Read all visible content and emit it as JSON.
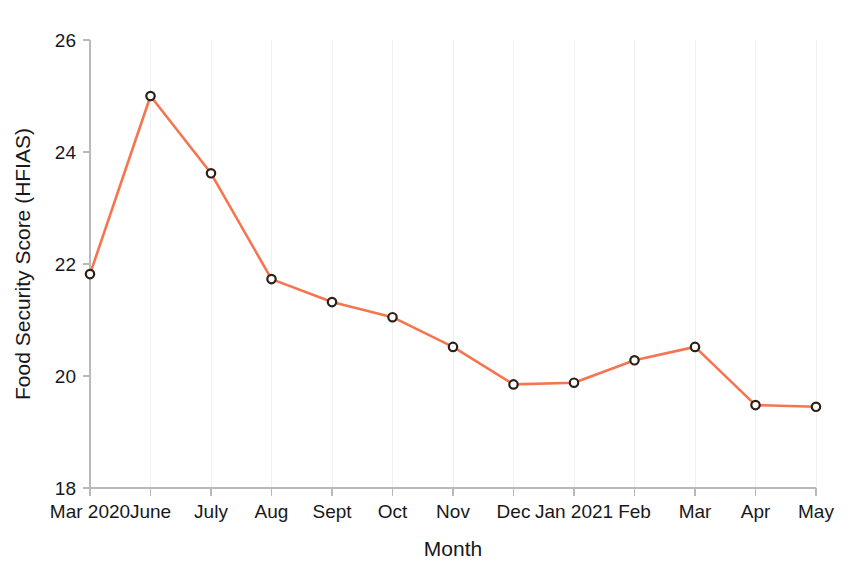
{
  "chart_data": {
    "type": "line",
    "title": "",
    "xlabel": "Month",
    "ylabel": "Food Security Score (HFIAS)",
    "categories": [
      "Mar 2020",
      "June",
      "July",
      "Aug",
      "Sept",
      "Oct",
      "Nov",
      "Dec",
      "Jan 2021",
      "Feb",
      "Mar",
      "Apr",
      "May"
    ],
    "values": [
      21.82,
      25.0,
      23.62,
      21.73,
      21.32,
      21.05,
      20.52,
      19.85,
      19.88,
      20.28,
      20.52,
      19.48,
      19.45
    ],
    "series": [
      {
        "name": "Food Security Score (HFIAS)",
        "values": [
          21.82,
          25.0,
          23.62,
          21.73,
          21.32,
          21.05,
          20.52,
          19.85,
          19.88,
          20.28,
          20.52,
          19.48,
          19.45
        ]
      }
    ],
    "ylim": [
      18,
      26
    ],
    "yticks": [
      18,
      20,
      22,
      24,
      26
    ],
    "ytick_labels": [
      "18",
      "20",
      "22",
      "24",
      "26"
    ],
    "xtick_labels": [
      "Mar 2020",
      "June",
      "July",
      "Aug",
      "Sept",
      "Oct",
      "Nov",
      "Dec",
      "Jan 2021",
      "Feb",
      "Mar",
      "Apr",
      "May"
    ],
    "grid": false,
    "legend": "none",
    "line_color": "#f4754f",
    "marker_edge_color": "#2b2119",
    "marker_face_color": "#ffffff",
    "axis_color": "#b9b9b9",
    "background_color": "#ffffff"
  },
  "layout": {
    "plot_left": 90,
    "plot_right": 816,
    "plot_top": 40,
    "plot_bottom": 488
  }
}
